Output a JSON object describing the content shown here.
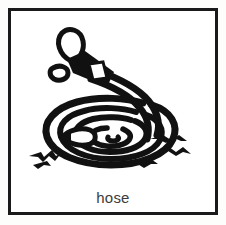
{
  "card": {
    "name": "picture-word-card",
    "background_color": "#ffffff",
    "outer_margin_color": "#fdfdfc"
  },
  "frame": {
    "name": "card-border",
    "border_color": "#1a1a1a",
    "border_width_px": 3
  },
  "illustration": {
    "name": "hose-illustration",
    "subject": "garden hose",
    "style": "black-and-white line drawing",
    "ink_color": "#111111",
    "fill_color": "#ffffff",
    "parts": [
      {
        "name": "spray-loop",
        "label": "spray loop"
      },
      {
        "name": "water-droplet",
        "label": "water droplet"
      },
      {
        "name": "nozzle",
        "label": "nozzle"
      },
      {
        "name": "nozzle-collar",
        "label": "nozzle collar"
      },
      {
        "name": "hose-tube",
        "label": "hose tube"
      },
      {
        "name": "hose-coil",
        "label": "coiled hose"
      },
      {
        "name": "hose-end-cap",
        "label": "hose end"
      },
      {
        "name": "ground-tuft-left",
        "label": "ground tuft left"
      },
      {
        "name": "ground-tuft-right",
        "label": "ground tuft right"
      }
    ]
  },
  "caption": {
    "text": "hose",
    "color": "#3b3b3b"
  }
}
